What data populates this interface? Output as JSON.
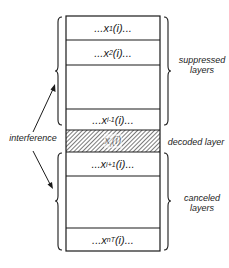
{
  "diagram": {
    "type": "layered stack with braces",
    "layers": [
      {
        "id": "x1",
        "prefix": "...x",
        "sub": "1",
        "suffix": "(i)...",
        "hatched": false
      },
      {
        "id": "x2",
        "prefix": "...x",
        "sub": "2",
        "suffix": "(i)...",
        "hatched": false
      },
      {
        "id": "gap-upper",
        "prefix": "",
        "sub": "",
        "suffix": "",
        "hatched": false
      },
      {
        "id": "xi-1",
        "prefix": "...x",
        "sub": "i-1",
        "suffix": "(i)...",
        "hatched": false
      },
      {
        "id": "xi",
        "prefix": "x",
        "sub": "i",
        "suffix": "(i)",
        "hatched": true
      },
      {
        "id": "xi+1",
        "prefix": "...x",
        "sub": "i+1",
        "suffix": "(i)...",
        "hatched": false
      },
      {
        "id": "gap-lower",
        "prefix": "",
        "sub": "",
        "suffix": "",
        "hatched": false
      },
      {
        "id": "xnt",
        "prefix": "...x",
        "sub": "nT",
        "suffix": "(i)...",
        "hatched": false
      }
    ],
    "labels": {
      "suppressed_line1": "suppressed",
      "suppressed_line2": "layers",
      "decoded": "decoded layer",
      "canceled_line1": "canceled",
      "canceled_line2": "layers",
      "interference": "interference"
    },
    "colors": {
      "stroke": "#1a1a1a",
      "hatch": "#333333",
      "background": "#ffffff"
    }
  }
}
